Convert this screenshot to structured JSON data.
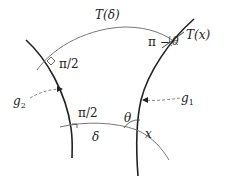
{
  "diagram": {
    "title": "",
    "labels": {
      "T_delta": "T(δ)",
      "pi_half_top": "π/2",
      "pi_minus_theta": "π −",
      "theta_small": "θ",
      "T_x": "T(x)",
      "g2": "g",
      "g2_sub": "2",
      "pi_half_bottom": "π/2",
      "delta": "δ",
      "theta": "θ",
      "x": "x",
      "g1": "g",
      "g1_sub": "1"
    },
    "curves": [
      {
        "id": "g2",
        "kind": "geodesic",
        "weight": "thick"
      },
      {
        "id": "g1",
        "kind": "geodesic",
        "weight": "thick"
      },
      {
        "id": "T_delta_arc",
        "kind": "arc",
        "weight": "thin"
      },
      {
        "id": "delta_arc",
        "kind": "arc",
        "weight": "thin"
      },
      {
        "id": "T_x_line",
        "kind": "segment",
        "weight": "thin"
      }
    ],
    "colors": {
      "thick": "#222222",
      "thin": "#666666",
      "dashed": "#777777",
      "text": "#222222"
    }
  }
}
